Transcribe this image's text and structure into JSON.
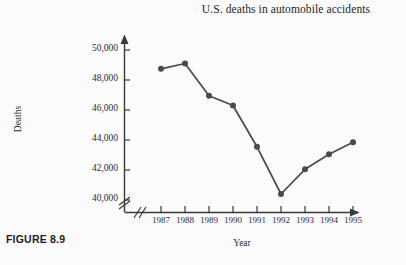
{
  "figure": {
    "caption": "FIGURE 8.9"
  },
  "chart_data": {
    "type": "line",
    "title": "U.S. deaths in automobile accidents",
    "xlabel": "Year",
    "ylabel": "Deaths",
    "categories": [
      "1987",
      "1988",
      "1989",
      "1990",
      "1991",
      "1992",
      "1993",
      "1994",
      "1995"
    ],
    "values": [
      48750,
      49100,
      46950,
      46300,
      43550,
      40400,
      42050,
      43050,
      43850
    ],
    "ylim": [
      39000,
      50800
    ],
    "yticks": [
      40000,
      42000,
      44000,
      46000,
      48000,
      50000
    ],
    "ytick_labels": [
      "40,000",
      "42,000",
      "44,000",
      "46,000",
      "48,000",
      "50,000"
    ],
    "grid": false,
    "legend": false,
    "axis_break_x": true,
    "axis_break_y": true,
    "line_color": "#4a4a4a",
    "marker_color": "#4a4a4a",
    "axis_color": "#3a3a3a",
    "background": "#fbfbfb"
  }
}
